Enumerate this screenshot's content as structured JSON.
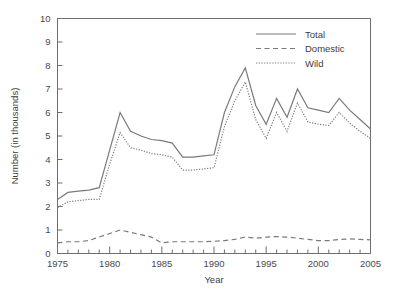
{
  "chart_data": {
    "type": "line",
    "title": "",
    "xlabel": "Year",
    "ylabel": "Number (in thousands)",
    "xlim": [
      1975,
      2005
    ],
    "ylim": [
      0,
      10
    ],
    "ytick_labels": [
      "0",
      "1",
      "2",
      "3",
      "4",
      "5",
      "6",
      "7",
      "8",
      "9",
      "10"
    ],
    "ytick_values": [
      0,
      1,
      2,
      3,
      4,
      5,
      6,
      7,
      8,
      9,
      10
    ],
    "xtick_labels": [
      "1975",
      "1980",
      "1985",
      "1990",
      "1995",
      "2000",
      "2005"
    ],
    "xtick_values": [
      1975,
      1980,
      1985,
      1990,
      1995,
      2000,
      2005
    ],
    "xminor_step": 1,
    "grid": false,
    "legend_position": "top-right",
    "x": [
      1975,
      1976,
      1977,
      1978,
      1979,
      1980,
      1981,
      1982,
      1983,
      1984,
      1985,
      1986,
      1987,
      1988,
      1989,
      1990,
      1991,
      1992,
      1993,
      1994,
      1995,
      1996,
      1997,
      1998,
      1999,
      2000,
      2001,
      2002,
      2003,
      2004,
      2005
    ],
    "series": [
      {
        "name": "Total",
        "style": "solid",
        "color": "#7a7a7a",
        "values": [
          2.3,
          2.6,
          2.65,
          2.7,
          2.8,
          4.4,
          6.0,
          5.2,
          5.0,
          4.85,
          4.8,
          4.7,
          4.1,
          4.1,
          4.15,
          4.2,
          6.0,
          7.1,
          7.9,
          6.3,
          5.5,
          6.6,
          5.8,
          7.0,
          6.2,
          6.1,
          6.0,
          6.6,
          6.1,
          5.7,
          5.3
        ]
      },
      {
        "name": "Domestic",
        "style": "dashed",
        "color": "#7a7a7a",
        "values": [
          0.45,
          0.5,
          0.5,
          0.55,
          0.7,
          0.85,
          1.0,
          0.9,
          0.8,
          0.7,
          0.45,
          0.5,
          0.5,
          0.5,
          0.5,
          0.52,
          0.55,
          0.6,
          0.7,
          0.65,
          0.7,
          0.72,
          0.7,
          0.65,
          0.6,
          0.55,
          0.55,
          0.6,
          0.62,
          0.6,
          0.58
        ]
      },
      {
        "name": "Wild",
        "style": "dotted",
        "color": "#7a7a7a",
        "values": [
          1.95,
          2.2,
          2.25,
          2.3,
          2.3,
          3.8,
          5.15,
          4.5,
          4.4,
          4.25,
          4.2,
          4.1,
          3.55,
          3.55,
          3.6,
          3.65,
          5.4,
          6.5,
          7.3,
          5.7,
          4.9,
          6.0,
          5.2,
          6.4,
          5.6,
          5.5,
          5.45,
          6.0,
          5.55,
          5.2,
          4.9
        ]
      }
    ]
  }
}
